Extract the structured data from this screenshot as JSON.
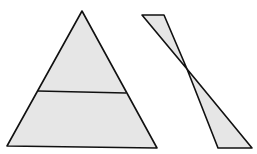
{
  "diagram": {
    "fill_color": "#e6e6e6",
    "stroke_color": "#111111",
    "stroke_width": 1.6,
    "shapes": [
      {
        "name": "large-triangle",
        "points": "82,11 7,146 157,148"
      },
      {
        "name": "triangle-midline",
        "points": "38,91 126,93"
      },
      {
        "name": "upper-small-triangle",
        "points": "142,15 164,15 187,69"
      },
      {
        "name": "lower-triangle",
        "points": "187,69 252,148 218,148"
      }
    ]
  }
}
